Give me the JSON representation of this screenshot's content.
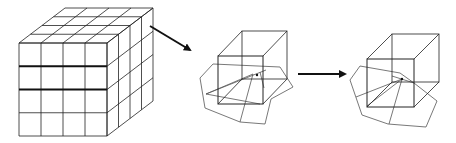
{
  "diagram": {
    "background": "#ffffff",
    "stroke_color": "#222222",
    "grid_cube": {
      "front": {
        "x": 19,
        "y": 43,
        "w": 88,
        "h": 93,
        "cols": 4,
        "rows": 4
      },
      "depth_dx": 46,
      "depth_dy": -35,
      "bold_rows": [
        1,
        2
      ]
    },
    "arrows": [
      {
        "name": "arrow-diagonal",
        "x1": 150,
        "y1": 26,
        "x2": 190,
        "y2": 50
      },
      {
        "name": "arrow-horizontal",
        "x1": 298,
        "y1": 74,
        "x2": 345,
        "y2": 74
      }
    ],
    "cells": [
      {
        "name": "cell-with-polyhedron-before",
        "cube_front": {
          "x": 218,
          "y": 56,
          "w": 45,
          "h": 48
        },
        "cube_back": {
          "x": 242,
          "y": 31,
          "w": 45,
          "h": 48
        },
        "polygon": [
          [
            200,
            78
          ],
          [
            213,
            64
          ],
          [
            280,
            67
          ],
          [
            293,
            87
          ],
          [
            271,
            99
          ],
          [
            265,
            124
          ],
          [
            240,
            122
          ],
          [
            205,
            108
          ]
        ],
        "inner_lines": [
          [
            [
              206,
              94
            ],
            [
              253,
              74
            ]
          ],
          [
            [
              206,
              94
            ],
            [
              266,
              70
            ]
          ],
          [
            [
              206,
              94
            ],
            [
              260,
              104
            ]
          ],
          [
            [
              253,
              74
            ],
            [
              240,
              122
            ]
          ],
          [
            [
              260,
              72
            ],
            [
              264,
              88
            ]
          ]
        ],
        "center_dot": [
          257,
          75
        ]
      },
      {
        "name": "cell-with-polyhedron-after",
        "cube_front": {
          "x": 367,
          "y": 59,
          "w": 47,
          "h": 48
        },
        "cube_back": {
          "x": 392,
          "y": 34,
          "w": 47,
          "h": 48
        },
        "polygon": [
          [
            350,
            80
          ],
          [
            360,
            66
          ],
          [
            400,
            73
          ],
          [
            414,
            83
          ],
          [
            437,
            101
          ],
          [
            426,
            127
          ],
          [
            388,
            124
          ],
          [
            362,
            115
          ]
        ],
        "inner_lines": [
          [
            [
              356,
              97
            ],
            [
              402,
              79
            ]
          ],
          [
            [
              367,
              106
            ],
            [
              402,
              79
            ]
          ],
          [
            [
              402,
              79
            ],
            [
              389,
              124
            ]
          ],
          [
            [
              392,
              76
            ],
            [
              414,
              83
            ]
          ]
        ],
        "center_dot": [
          402,
          79
        ]
      }
    ]
  }
}
